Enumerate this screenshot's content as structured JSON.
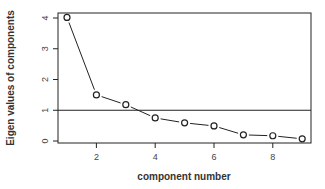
{
  "chart_data": {
    "type": "line",
    "title": "",
    "xlabel": "component number",
    "ylabel": "Eigen values of components",
    "x": [
      1,
      2,
      3,
      4,
      5,
      6,
      7,
      8,
      9
    ],
    "values": [
      4.02,
      1.5,
      1.18,
      0.75,
      0.59,
      0.49,
      0.2,
      0.17,
      0.07
    ],
    "xticks": [
      "2",
      "4",
      "6",
      "8"
    ],
    "yticks": [
      "0",
      "1",
      "2",
      "3",
      "4"
    ],
    "xlim": [
      0.7,
      9.3
    ],
    "ylim": [
      -0.08,
      4.2
    ],
    "reference_line": {
      "orientation": "horizontal",
      "y": 1
    },
    "marker": "open-circle",
    "grid": false,
    "legend": null
  }
}
